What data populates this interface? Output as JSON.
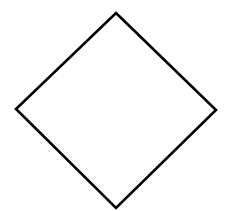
{
  "diagram": {
    "background": "#ffffff",
    "shapes": [
      {
        "type": "diamond",
        "points": {
          "top": [
            116,
            13
          ],
          "right": [
            216,
            110
          ],
          "bottom": [
            116,
            208
          ],
          "left": [
            16,
            109
          ]
        },
        "fill": "#ffffff",
        "stroke": "#000000",
        "stroke_width": 2.6
      }
    ]
  }
}
